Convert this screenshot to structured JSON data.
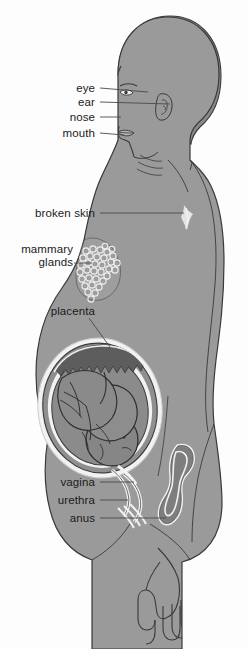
{
  "diagram": {
    "colors": {
      "background": "#fdfdfd",
      "body_fill": "#9a9a9a",
      "body_fill_shadow": "#8d8d8d",
      "hair_fill": "#8a8a8a",
      "outline": "#3a3a3a",
      "leader_line": "#4a4a4a",
      "label_text": "#1b1b1b",
      "amniotic_white": "#f2f2f2",
      "uterus_wall": "#7e7e7e",
      "fetus_fill": "#868686",
      "placenta_dark": "#5d5d5d",
      "gland_outline": "#f0f0f0"
    },
    "labels": [
      {
        "id": "eye",
        "text": "eye",
        "x": 95,
        "y": 88,
        "leader_to_x": 148,
        "leader_to_y": 92
      },
      {
        "id": "ear",
        "text": "ear",
        "x": 95,
        "y": 102,
        "leader_to_x": 170,
        "leader_to_y": 104
      },
      {
        "id": "nose",
        "text": "nose",
        "x": 95,
        "y": 117,
        "leader_to_x": 121,
        "leader_to_y": 117
      },
      {
        "id": "mouth",
        "text": "mouth",
        "x": 95,
        "y": 133,
        "leader_to_x": 124,
        "leader_to_y": 135
      },
      {
        "id": "broken-skin",
        "text": "broken skin",
        "x": 95,
        "y": 213,
        "leader_to_x": 184,
        "leader_to_y": 213
      },
      {
        "id": "mammary-glands",
        "text": "mammary\nglands",
        "x": 95,
        "y": 248,
        "leader_to_x": 92,
        "leader_to_y": 263
      },
      {
        "id": "placenta",
        "text": "placenta",
        "x": 95,
        "y": 311,
        "leader_to_x": 110,
        "leader_to_y": 345
      },
      {
        "id": "vagina",
        "text": "vagina",
        "x": 95,
        "y": 482,
        "leader_to_x": 134,
        "leader_to_y": 482
      },
      {
        "id": "urethra",
        "text": "urethra",
        "x": 95,
        "y": 500,
        "leader_to_x": 128,
        "leader_to_y": 500
      },
      {
        "id": "anus",
        "text": "anus",
        "x": 95,
        "y": 518,
        "leader_to_x": 166,
        "leader_to_y": 518
      }
    ],
    "features": {
      "fetus_position": "head-down (cephalic)",
      "mammary_gland_count": 34,
      "view": "left lateral sagittal"
    }
  }
}
